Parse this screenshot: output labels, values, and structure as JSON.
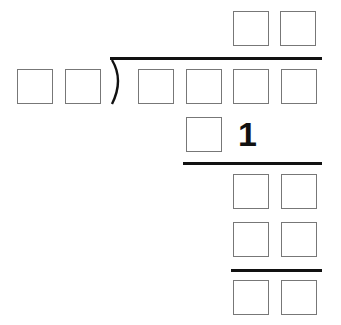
{
  "problem": {
    "type": "long-division",
    "quotient": [
      "",
      ""
    ],
    "divisor": [
      "",
      ""
    ],
    "dividend": [
      "",
      "",
      "",
      ""
    ],
    "step1_product": [
      "",
      "1"
    ],
    "step1_remainder": [
      "",
      ""
    ],
    "step2_product": [
      "",
      ""
    ],
    "final_remainder": [
      "",
      ""
    ]
  },
  "colors": {
    "box_border": "#777777",
    "line": "#111111"
  }
}
